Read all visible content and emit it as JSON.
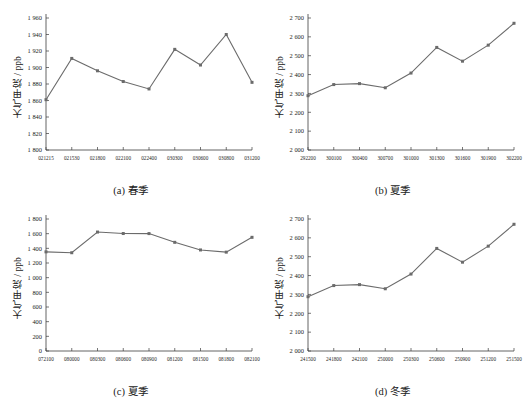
{
  "figure": {
    "background": "#ffffff",
    "series_color": "#6b6b6b",
    "axis_color": "#3c3c3c"
  },
  "chart_data": [
    {
      "id": "a",
      "type": "line",
      "title": "(a) 春季",
      "caption": "(a) 春季",
      "xlabel": "",
      "ylabel": "大气甲烷 / ppb",
      "ylim": [
        1800,
        1960
      ],
      "yticks": [
        1800,
        1820,
        1840,
        1860,
        1880,
        1900,
        1920,
        1940,
        1960
      ],
      "ytick_labels": [
        "1 800",
        "1 820",
        "1 840",
        "1 860",
        "1 880",
        "1 900",
        "1 920",
        "1 940",
        "1 960"
      ],
      "categories": [
        "021215",
        "021530",
        "021800",
        "022100",
        "022400",
        "030300",
        "030600",
        "030800",
        "031200"
      ],
      "values": [
        1861,
        1911,
        1896,
        1883,
        1874,
        1922,
        1903,
        1940,
        1882
      ],
      "grid": false,
      "legend": "none",
      "marker": "square"
    },
    {
      "id": "b",
      "type": "line",
      "title": "(b) 夏季",
      "caption": "(b) 夏季",
      "xlabel": "",
      "ylabel": "大气甲烷 / ppb",
      "ylim": [
        2000,
        2700
      ],
      "yticks": [
        2000,
        2100,
        2200,
        2300,
        2400,
        2500,
        2600,
        2700
      ],
      "ytick_labels": [
        "2 000",
        "2 100",
        "2 200",
        "2 300",
        "2 400",
        "2 500",
        "2 600",
        "2 700"
      ],
      "categories": [
        "292200",
        "300100",
        "300400",
        "300700",
        "301000",
        "301300",
        "301600",
        "301900",
        "302200"
      ],
      "values": [
        2288,
        2347,
        2352,
        2330,
        2408,
        2544,
        2471,
        2556,
        2672
      ],
      "grid": false,
      "legend": "none",
      "marker": "square"
    },
    {
      "id": "c",
      "type": "line",
      "title": "(c) 夏季",
      "caption": "(c) 夏季",
      "xlabel": "",
      "ylabel": "大气甲烷 / ppb",
      "ylim": [
        0,
        1800
      ],
      "yticks": [
        0,
        200,
        400,
        600,
        800,
        1000,
        1200,
        1400,
        1600,
        1800
      ],
      "ytick_labels": [
        "0",
        "200",
        "400",
        "600",
        "800",
        "1 000",
        "1 200",
        "1 400",
        "1 600",
        "1 800"
      ],
      "categories": [
        "072100",
        "080000",
        "080300",
        "080600",
        "080900",
        "081200",
        "081500",
        "081800",
        "082100"
      ],
      "values": [
        1352,
        1340,
        1622,
        1602,
        1601,
        1482,
        1378,
        1348,
        1550
      ],
      "grid": false,
      "legend": "none",
      "marker": "square"
    },
    {
      "id": "d",
      "type": "line",
      "title": "(d) 冬季",
      "caption": "(d) 冬季",
      "xlabel": "",
      "ylabel": "大气甲烷 / ppb",
      "ylim": [
        2000,
        2700
      ],
      "yticks": [
        2000,
        2100,
        2200,
        2300,
        2400,
        2500,
        2600,
        2700
      ],
      "ytick_labels": [
        "2 000",
        "2 100",
        "2 200",
        "2 300",
        "2 400",
        "2 500",
        "2 600",
        "2 700"
      ],
      "categories": [
        "241500",
        "241800",
        "242100",
        "250000",
        "250300",
        "250600",
        "250900",
        "251200",
        "251500"
      ],
      "values": [
        2288,
        2347,
        2352,
        2330,
        2408,
        2544,
        2471,
        2556,
        2672
      ],
      "grid": false,
      "legend": "none",
      "marker": "square"
    }
  ]
}
